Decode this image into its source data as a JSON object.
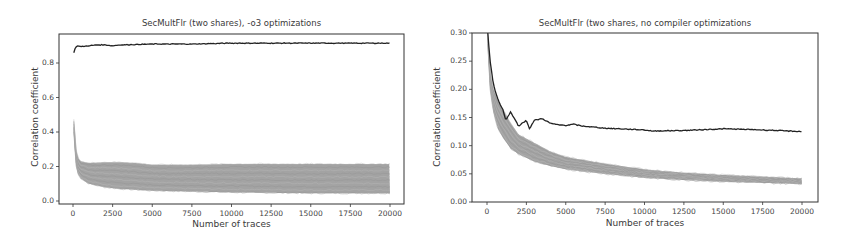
{
  "chart_data": [
    {
      "type": "line",
      "title": "SecMultFlr (two shares), -o3 optimizations",
      "xlabel": "Number of traces",
      "ylabel": "Correlation coefficient",
      "xlim": [
        -1000,
        21000
      ],
      "ylim": [
        -0.02,
        0.97
      ],
      "xticks": [
        0,
        2500,
        5000,
        7500,
        10000,
        12500,
        15000,
        17500,
        20000
      ],
      "xtick_labels": [
        "0",
        "2500",
        "5000",
        "7500",
        "10000",
        "12500",
        "15000",
        "17500",
        "20000"
      ],
      "yticks": [
        0.0,
        0.2,
        0.4,
        0.6,
        0.8
      ],
      "ytick_labels": [
        "0.0",
        "0.2",
        "0.4",
        "0.6",
        "0.8"
      ],
      "grid": false,
      "legend": null,
      "series": [
        {
          "name": "correct key hypothesis",
          "color": "#222222",
          "x": [
            50,
            150,
            300,
            500,
            1000,
            1500,
            2000,
            2500,
            3000,
            5000,
            7500,
            10000,
            12500,
            15000,
            17500,
            20000
          ],
          "values": [
            0.86,
            0.89,
            0.9,
            0.895,
            0.9,
            0.905,
            0.905,
            0.9,
            0.905,
            0.91,
            0.91,
            0.915,
            0.915,
            0.915,
            0.915,
            0.915
          ]
        },
        {
          "name": "wrong key hypotheses (upper envelope)",
          "color": "#a0a0a0",
          "x": [
            50,
            150,
            300,
            500,
            1000,
            2000,
            3000,
            4000,
            5000,
            7500,
            10000,
            15000,
            20000
          ],
          "values": [
            0.47,
            0.32,
            0.25,
            0.23,
            0.22,
            0.225,
            0.225,
            0.22,
            0.21,
            0.21,
            0.215,
            0.215,
            0.215
          ]
        },
        {
          "name": "wrong key hypotheses (lower envelope)",
          "color": "#a0a0a0",
          "x": [
            50,
            150,
            300,
            500,
            1000,
            2000,
            3000,
            5000,
            7500,
            10000,
            15000,
            20000
          ],
          "values": [
            0.4,
            0.22,
            0.16,
            0.13,
            0.1,
            0.08,
            0.07,
            0.06,
            0.055,
            0.05,
            0.045,
            0.045
          ]
        }
      ]
    },
    {
      "type": "line",
      "title": "SecMultFlr (two shares, no compiler optimizations",
      "xlabel": "Number of traces",
      "ylabel": "Correlation coefficient",
      "xlim": [
        -1000,
        21000
      ],
      "ylim": [
        0.0,
        0.3
      ],
      "xticks": [
        0,
        2500,
        5000,
        7500,
        10000,
        12500,
        15000,
        17500,
        20000
      ],
      "xtick_labels": [
        "0",
        "2500",
        "5000",
        "7500",
        "10000",
        "12500",
        "15000",
        "17500",
        "20000"
      ],
      "yticks": [
        0.0,
        0.05,
        0.1,
        0.15,
        0.2,
        0.25,
        0.3
      ],
      "ytick_labels": [
        "0.00",
        "0.05",
        "0.10",
        "0.15",
        "0.20",
        "0.25",
        "0.30"
      ],
      "grid": false,
      "legend": null,
      "series": [
        {
          "name": "correct key hypothesis",
          "color": "#222222",
          "x": [
            50,
            200,
            400,
            600,
            800,
            1000,
            1200,
            1500,
            2000,
            2500,
            2700,
            3000,
            3500,
            4000,
            4500,
            5000,
            5500,
            6000,
            7500,
            10000,
            10500,
            12500,
            15000,
            17500,
            20000
          ],
          "values": [
            0.3,
            0.25,
            0.21,
            0.19,
            0.175,
            0.165,
            0.145,
            0.16,
            0.135,
            0.145,
            0.13,
            0.145,
            0.148,
            0.14,
            0.137,
            0.136,
            0.138,
            0.135,
            0.131,
            0.128,
            0.126,
            0.127,
            0.13,
            0.128,
            0.125
          ]
        },
        {
          "name": "wrong key hypotheses (upper envelope)",
          "color": "#a8a8a8",
          "x": [
            50,
            200,
            400,
            700,
            1000,
            1500,
            2000,
            3000,
            4000,
            5000,
            7500,
            10000,
            12500,
            15000,
            17500,
            20000
          ],
          "values": [
            0.3,
            0.23,
            0.2,
            0.18,
            0.165,
            0.14,
            0.12,
            0.105,
            0.09,
            0.08,
            0.068,
            0.058,
            0.052,
            0.048,
            0.045,
            0.042
          ]
        },
        {
          "name": "wrong key hypotheses (lower envelope)",
          "color": "#a8a8a8",
          "x": [
            50,
            200,
            400,
            700,
            1000,
            1500,
            2000,
            3000,
            4000,
            5000,
            7500,
            10000,
            12500,
            15000,
            17500,
            20000
          ],
          "values": [
            0.28,
            0.2,
            0.16,
            0.13,
            0.115,
            0.095,
            0.085,
            0.072,
            0.064,
            0.058,
            0.05,
            0.043,
            0.039,
            0.036,
            0.034,
            0.032
          ]
        }
      ]
    }
  ],
  "left": {
    "title": "SecMultFlr (two shares), -o3 optimizations",
    "xlabel": "Number of traces",
    "ylabel": "Correlation coefficient",
    "yticks": [
      "0.0",
      "0.2",
      "0.4",
      "0.6",
      "0.8"
    ],
    "xticks": [
      "0",
      "2500",
      "5000",
      "7500",
      "10000",
      "12500",
      "15000",
      "17500",
      "20000"
    ]
  },
  "right": {
    "title": "SecMultFlr (two shares, no compiler optimizations",
    "xlabel": "Number of traces",
    "ylabel": "Correlation coefficient",
    "yticks": [
      "0.00",
      "0.05",
      "0.10",
      "0.15",
      "0.20",
      "0.25",
      "0.30"
    ],
    "xticks": [
      "0",
      "2500",
      "5000",
      "7500",
      "10000",
      "12500",
      "15000",
      "17500",
      "20000"
    ]
  },
  "colors": {
    "correct_line": "#222222",
    "wrong_band": "#a3a3a3",
    "axes": "#333333"
  }
}
